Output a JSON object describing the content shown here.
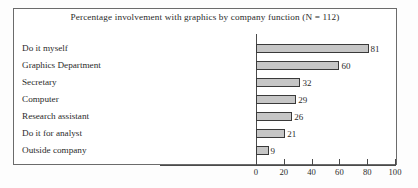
{
  "chart_data": {
    "type": "bar",
    "orientation": "horizontal",
    "title": "Percentage involvement with graphics by company function (N = 112)",
    "xlabel": "",
    "ylabel": "",
    "categories": [
      "Do it myself",
      "Graphics Department",
      "Secretary",
      "Computer",
      "Research assistant",
      "Do it for analyst",
      "Outside company"
    ],
    "values": [
      81,
      60,
      32,
      29,
      26,
      21,
      9
    ],
    "value_labels": [
      "81",
      "60",
      "32",
      "29",
      "26",
      "21",
      "9"
    ],
    "xlim": [
      0,
      100
    ],
    "xticks": [
      0,
      20,
      40,
      60,
      80,
      100
    ],
    "xtick_labels": [
      "0",
      "20",
      "40",
      "60",
      "80",
      "100"
    ],
    "grid": false,
    "legend": false,
    "sample_size": 112,
    "bar_fill_color": "#c6c6c6",
    "bar_edge_color": "#3a3a3a",
    "axis_color": "#4a4a4a",
    "frame_color": "#6b6b6b",
    "background_color": "#ffffff"
  }
}
